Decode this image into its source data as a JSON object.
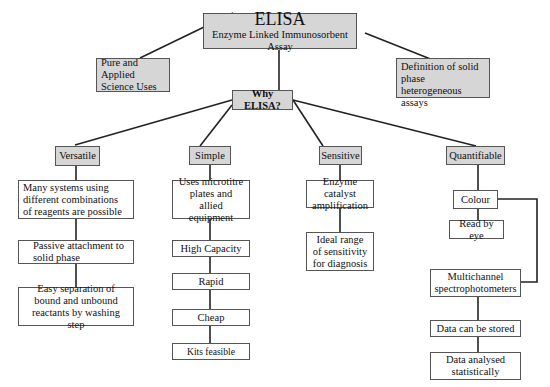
{
  "title": {
    "main": "ELISA",
    "subtitle": "Enzyme Linked Immunosorbent Assay"
  },
  "side_nodes": {
    "left": "Pure and Applied Science Uses",
    "right": "Definition of solid phase heterogeneous assays"
  },
  "hub": "Why ELISA?",
  "branches": [
    {
      "label": "Versatile",
      "items": [
        "Many systems using different combinations of reagents are possible",
        "Passive attachment to solid phase",
        "Easy separation of bound and unbound reactants by washing step"
      ]
    },
    {
      "label": "Simple",
      "items": [
        "Uses microtitre plates and allied equipment",
        "High Capacity",
        "Rapid",
        "Cheap",
        "Kits feasible"
      ]
    },
    {
      "label": "Sensitive",
      "items": [
        "Enzyme catalyst amplification",
        "Ideal range of sensitivity for diagnosis"
      ]
    },
    {
      "label": "Quantifiable",
      "items": [
        "Colour",
        "Read by eye",
        "Multichannel spectrophotometers",
        "Data can be stored",
        "Data analysed statistically"
      ]
    }
  ]
}
